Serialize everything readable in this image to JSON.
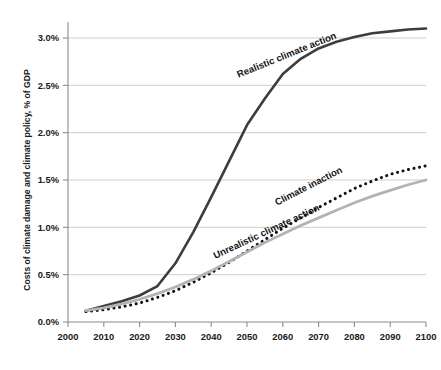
{
  "chart_data": {
    "type": "line",
    "title": "",
    "xlabel": "",
    "ylabel": "Costs of climate damage and climate policy, % of GDP",
    "xlim": [
      2000,
      2100
    ],
    "ylim": [
      0.0,
      3.0
    ],
    "xticks": [
      2000,
      2010,
      2020,
      2030,
      2040,
      2050,
      2060,
      2070,
      2080,
      2090,
      2100
    ],
    "xtick_labels": [
      "2000",
      "2010",
      "2020",
      "2030",
      "2040",
      "2050",
      "2060",
      "2070",
      "2080",
      "2090",
      "2100"
    ],
    "yticks": [
      0.0,
      0.5,
      1.0,
      1.5,
      2.0,
      2.5,
      3.0
    ],
    "ytick_labels": [
      "0.0%",
      "0.5%",
      "1.0%",
      "1.5%",
      "2.0%",
      "2.5%",
      "3.0%"
    ],
    "grid": "horizontal",
    "legend": "inline-annotations",
    "x": [
      2005,
      2010,
      2015,
      2020,
      2025,
      2030,
      2035,
      2040,
      2045,
      2050,
      2055,
      2060,
      2065,
      2070,
      2075,
      2080,
      2085,
      2090,
      2095,
      2100
    ],
    "series": [
      {
        "name": "Realistic climate action",
        "style": "solid",
        "color": "#3d3d3d",
        "width": 2.6,
        "values": [
          0.12,
          0.17,
          0.22,
          0.28,
          0.38,
          0.62,
          0.95,
          1.32,
          1.7,
          2.08,
          2.36,
          2.62,
          2.78,
          2.89,
          2.96,
          3.01,
          3.05,
          3.07,
          3.09,
          3.1
        ],
        "label_text": "Realistic climate action",
        "label_x": 337,
        "label_y": 38,
        "label_rotation": -22
      },
      {
        "name": "Climate inaction",
        "style": "dotted",
        "color": "#111111",
        "width": 3.0,
        "values": [
          0.11,
          0.13,
          0.16,
          0.2,
          0.26,
          0.33,
          0.42,
          0.52,
          0.63,
          0.75,
          0.87,
          0.99,
          1.1,
          1.21,
          1.31,
          1.41,
          1.49,
          1.56,
          1.61,
          1.65
        ],
        "label_text": "Climate inaction",
        "label_x": 343,
        "label_y": 172,
        "label_rotation": -27
      },
      {
        "name": "Unrealistic climate action",
        "style": "solid",
        "color": "#b3b3b3",
        "width": 2.8,
        "values": [
          0.12,
          0.15,
          0.19,
          0.24,
          0.3,
          0.37,
          0.45,
          0.54,
          0.64,
          0.74,
          0.84,
          0.93,
          1.02,
          1.1,
          1.18,
          1.26,
          1.33,
          1.39,
          1.45,
          1.5
        ],
        "label_text": "Unrealistic climate action",
        "label_x": 320,
        "label_y": 210,
        "label_rotation": -25
      }
    ]
  },
  "colors": {
    "axis": "#8c8c8c",
    "grid": "#c9c9c9",
    "text": "#1a1a1a",
    "background": "#ffffff"
  }
}
